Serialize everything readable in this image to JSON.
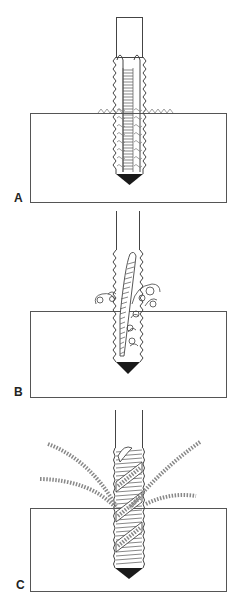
{
  "diagram": {
    "colors": {
      "line": "#444444",
      "fill_tip": "#1a1a1a",
      "background": "#ffffff",
      "chip": "#888888"
    },
    "panels": [
      {
        "id": "A",
        "label": "A",
        "caption_hidden": "Straight-flute tap: chips pack in flutes"
      },
      {
        "id": "B",
        "label": "B",
        "caption_hidden": "Spiral-point tap: chips curl ahead"
      },
      {
        "id": "C",
        "label": "C",
        "caption_hidden": "Spiral-flute tap: chips eject upward"
      }
    ]
  }
}
